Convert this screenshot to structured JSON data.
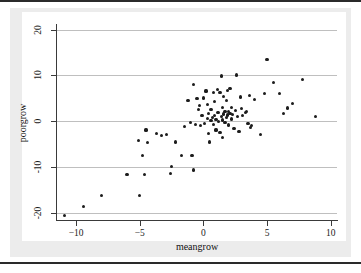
{
  "figure": {
    "background_color": "#ececec",
    "canvas_color": "#ffffff",
    "marker_color": "#1c1c1c",
    "gridline_color": "#bfbfbf",
    "axis_color": "#3a3a3a"
  },
  "chart_data": {
    "type": "scatter",
    "title": "",
    "xlabel": "meangrow",
    "ylabel": "poorgrow",
    "xlim": [
      -11.5,
      10.5
    ],
    "ylim": [
      -21.5,
      21.0
    ],
    "xticks": [
      -10,
      -5,
      0,
      5,
      10
    ],
    "xtick_labels": [
      "-10",
      "-5",
      "0",
      "5",
      "10"
    ],
    "yticks": [
      20,
      10,
      0,
      -10,
      -20
    ],
    "ytick_labels": [
      "20",
      "10",
      "0",
      "-10",
      "-20"
    ],
    "grid": "horizontal",
    "legend": "none",
    "series": [
      {
        "name": "countries",
        "marker": "filled-circle",
        "points": [
          [
            -10.9,
            -20.6
          ],
          [
            -9.4,
            -18.6
          ],
          [
            -8.0,
            -16.2
          ],
          [
            -6.0,
            -11.5
          ],
          [
            -5.0,
            -16.1
          ],
          [
            -5.1,
            -4.2
          ],
          [
            -4.8,
            -7.5
          ],
          [
            -4.6,
            -11.6
          ],
          [
            -4.5,
            -1.9
          ],
          [
            -4.4,
            -4.6
          ],
          [
            -3.7,
            -2.6
          ],
          [
            -3.3,
            -3.1
          ],
          [
            -2.9,
            -2.9
          ],
          [
            -2.6,
            -11.3
          ],
          [
            -2.5,
            -9.8
          ],
          [
            -2.2,
            -4.5
          ],
          [
            -1.7,
            -7.4
          ],
          [
            -1.5,
            -1.2
          ],
          [
            -1.2,
            4.5
          ],
          [
            -1.0,
            -0.3
          ],
          [
            -0.9,
            -7.5
          ],
          [
            -0.8,
            8.1
          ],
          [
            -0.8,
            -10.6
          ],
          [
            -0.6,
            -0.6
          ],
          [
            -0.5,
            5.0
          ],
          [
            -0.4,
            2.6
          ],
          [
            -0.3,
            3.4
          ],
          [
            -0.2,
            -0.9
          ],
          [
            -0.1,
            1.2
          ],
          [
            0.0,
            5.1
          ],
          [
            0.1,
            -0.5
          ],
          [
            0.2,
            6.6
          ],
          [
            0.3,
            3.7
          ],
          [
            0.3,
            0.6
          ],
          [
            0.4,
            1.8
          ],
          [
            0.4,
            -2.6
          ],
          [
            0.5,
            -4.5
          ],
          [
            0.6,
            0.2
          ],
          [
            0.6,
            2.5
          ],
          [
            0.7,
            0.9
          ],
          [
            0.8,
            6.2
          ],
          [
            0.8,
            -0.7
          ],
          [
            0.9,
            1.3
          ],
          [
            0.9,
            4.4
          ],
          [
            1.0,
            0.4
          ],
          [
            1.0,
            -1.9
          ],
          [
            1.1,
            1.9
          ],
          [
            1.1,
            7.0
          ],
          [
            1.2,
            0.0
          ],
          [
            1.2,
            2.0
          ],
          [
            1.3,
            -2.4
          ],
          [
            1.3,
            6.3
          ],
          [
            1.4,
            1.0
          ],
          [
            1.4,
            9.9
          ],
          [
            1.5,
            0.3
          ],
          [
            1.5,
            3.1
          ],
          [
            1.5,
            -3.6
          ],
          [
            1.6,
            1.6
          ],
          [
            1.6,
            5.5
          ],
          [
            1.7,
            -0.2
          ],
          [
            1.7,
            2.2
          ],
          [
            1.8,
            0.8
          ],
          [
            1.8,
            4.6
          ],
          [
            1.9,
            1.4
          ],
          [
            1.9,
            6.8
          ],
          [
            2.0,
            2.1
          ],
          [
            2.0,
            -0.8
          ],
          [
            2.1,
            1.7
          ],
          [
            2.1,
            7.2
          ],
          [
            2.2,
            0.5
          ],
          [
            2.2,
            3.0
          ],
          [
            2.3,
            1.5
          ],
          [
            2.4,
            -1.6
          ],
          [
            2.5,
            2.4
          ],
          [
            2.6,
            10.1
          ],
          [
            2.7,
            1.1
          ],
          [
            2.8,
            -2.2
          ],
          [
            2.9,
            5.3
          ],
          [
            3.0,
            2.8
          ],
          [
            3.1,
            1.2
          ],
          [
            3.3,
            1.9
          ],
          [
            3.4,
            2.2
          ],
          [
            3.5,
            -0.4
          ],
          [
            3.6,
            5.6
          ],
          [
            3.7,
            -1.4
          ],
          [
            3.8,
            -0.9
          ],
          [
            4.0,
            4.8
          ],
          [
            4.5,
            -2.8
          ],
          [
            4.8,
            6.1
          ],
          [
            5.0,
            13.4
          ],
          [
            5.5,
            8.5
          ],
          [
            6.0,
            6.0
          ],
          [
            6.3,
            1.8
          ],
          [
            6.6,
            2.9
          ],
          [
            7.0,
            3.9
          ],
          [
            7.8,
            9.1
          ],
          [
            8.8,
            1.0
          ]
        ]
      }
    ]
  }
}
